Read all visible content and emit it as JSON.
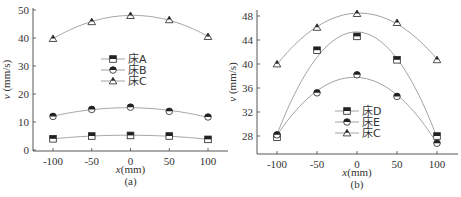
{
  "chart_data": [
    {
      "type": "line",
      "panel": "(a)",
      "caption": "(a)",
      "xlabel": "x(mm)",
      "ylabel": "v (mm/s)",
      "x": [
        -100,
        -50,
        0,
        50,
        100
      ],
      "xticks": [
        "-100",
        "-50",
        "0",
        "50",
        "100"
      ],
      "yticks": [
        "0",
        "10",
        "20",
        "30",
        "40",
        "50"
      ],
      "ylim": [
        0,
        50
      ],
      "xlim": [
        -125,
        125
      ],
      "grid": false,
      "legend_position": "center",
      "series": [
        {
          "name": "床A",
          "marker": "square",
          "values": [
            4.0,
            5.0,
            5.2,
            5.0,
            3.8
          ]
        },
        {
          "name": "床B",
          "marker": "circle",
          "values": [
            12.0,
            14.5,
            15.3,
            13.8,
            11.8
          ]
        },
        {
          "name": "床C",
          "marker": "triangle",
          "values": [
            39.8,
            45.8,
            48.0,
            46.5,
            40.5
          ]
        }
      ]
    },
    {
      "type": "line",
      "panel": "(b)",
      "caption": "(b)",
      "xlabel": "x(mm)",
      "ylabel": "v (mm/s)",
      "x": [
        -100,
        -50,
        0,
        50,
        100
      ],
      "xticks": [
        "-100",
        "-50",
        "0",
        "50",
        "100"
      ],
      "yticks": [
        "28",
        "32",
        "36",
        "40",
        "44",
        "48"
      ],
      "ylim": [
        25,
        49
      ],
      "xlim": [
        -125,
        125
      ],
      "grid": false,
      "legend_position": "lower center",
      "series": [
        {
          "name": "床D",
          "marker": "square",
          "values": [
            27.8,
            42.3,
            44.6,
            40.7,
            28.0
          ]
        },
        {
          "name": "床E",
          "marker": "circle",
          "values": [
            28.2,
            35.2,
            38.2,
            34.6,
            26.8
          ]
        },
        {
          "name": "床C",
          "marker": "triangle",
          "values": [
            40.0,
            46.1,
            48.4,
            46.9,
            40.7
          ]
        }
      ]
    }
  ]
}
